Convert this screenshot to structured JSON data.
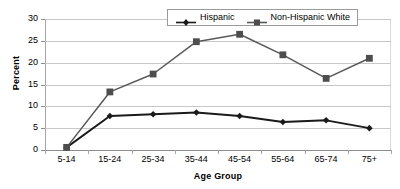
{
  "chart_data": {
    "type": "line",
    "title": "",
    "xlabel": "Age Group",
    "ylabel": "Percent",
    "categories": [
      "5-14",
      "15-24",
      "25-34",
      "35-44",
      "45-54",
      "55-64",
      "65-74",
      "75+"
    ],
    "ylim": [
      0,
      30
    ],
    "yticks": [
      0,
      5,
      10,
      15,
      20,
      25,
      30
    ],
    "grid": true,
    "legend_position": "top-center",
    "series": [
      {
        "name": "Hispanic",
        "marker": "diamond",
        "color": "#1a1a1a",
        "values": [
          0.6,
          7.8,
          8.2,
          8.6,
          7.8,
          6.4,
          6.8,
          5.0
        ]
      },
      {
        "name": "Non-Hispanic White",
        "marker": "square",
        "color": "#595959",
        "values": [
          0.6,
          13.3,
          17.4,
          24.8,
          26.5,
          21.8,
          16.4,
          21.0
        ]
      }
    ]
  },
  "axis": {
    "y_title": "Percent",
    "x_title": "Age Group"
  }
}
